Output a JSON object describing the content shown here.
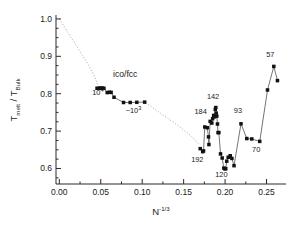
{
  "figure": {
    "background": "#ffffff",
    "marker_color": "#111111",
    "line_color": "#3a3a3a",
    "guide_color": "#9a9a9a",
    "axis_color": "#2b2b2b"
  },
  "axes": {
    "x_title_main": "N",
    "x_title_sup": "-1/3",
    "y_title_t": "T",
    "y_title_melt": "melt",
    "y_title_slash": " / T",
    "y_title_bulk": "Bulk",
    "x_ticks": [
      "0.00",
      "0.05",
      "0.10",
      "0.15",
      "0.20",
      "0.25"
    ],
    "x_tick_values": [
      0.0,
      0.05,
      0.1,
      0.15,
      0.2,
      0.25
    ],
    "y_ticks": [
      "0.6",
      "0.7",
      "0.8",
      "0.9",
      "1.0"
    ],
    "y_tick_values": [
      0.6,
      0.7,
      0.8,
      0.9,
      1.0
    ],
    "xlim": [
      -0.004,
      0.2735
    ],
    "ylim": [
      0.5585,
      1.0105
    ],
    "grid": "off"
  },
  "annotations": [
    {
      "name": "ico-fcc",
      "text": "ico/fcc",
      "x": 0.0795,
      "y": 0.846,
      "size": "normal"
    },
    {
      "name": "ten-to-four",
      "text": "10",
      "sup": "4",
      "x": 0.0465,
      "y": 0.797,
      "size": "small"
    },
    {
      "name": "ten-to-three",
      "text": "~10",
      "sup": "3",
      "x": 0.0895,
      "y": 0.749,
      "size": "small"
    },
    {
      "name": "label-184",
      "text": "184",
      "x": 0.1705,
      "y": 0.747,
      "size": "small"
    },
    {
      "name": "label-142",
      "text": "142",
      "x": 0.1855,
      "y": 0.787,
      "size": "small"
    },
    {
      "name": "label-192",
      "text": "192",
      "x": 0.1665,
      "y": 0.617,
      "size": "small"
    },
    {
      "name": "label-120",
      "text": "120",
      "x": 0.1955,
      "y": 0.578,
      "size": "small"
    },
    {
      "name": "label-93",
      "text": "93",
      "x": 0.2155,
      "y": 0.748,
      "size": "small"
    },
    {
      "name": "label-70",
      "text": "70",
      "x": 0.2375,
      "y": 0.643,
      "size": "small"
    },
    {
      "name": "label-57",
      "text": "57",
      "x": 0.2545,
      "y": 0.898,
      "size": "small"
    }
  ],
  "chart_data": {
    "type": "scatter",
    "title": "",
    "xlabel": "N^-1/3",
    "ylabel": "T_melt / T_Bulk",
    "xlim": [
      -0.004,
      0.2735
    ],
    "ylim": [
      0.5585,
      1.0105
    ],
    "grid": "off",
    "legend": "none",
    "series": [
      {
        "name": "ico/fcc plateau (large clusters)",
        "marker": "square",
        "connected": true,
        "points": [
          [
            0.0455,
            0.8145
          ],
          [
            0.048,
            0.815
          ],
          [
            0.05,
            0.815
          ],
          [
            0.0518,
            0.815
          ],
          [
            0.0538,
            0.8145
          ],
          [
            0.0578,
            0.803
          ],
          [
            0.0605,
            0.804
          ],
          [
            0.0625,
            0.8035
          ],
          [
            0.066,
            0.7905
          ],
          [
            0.0775,
            0.7765
          ],
          [
            0.0855,
            0.7765
          ],
          [
            0.0935,
            0.777
          ],
          [
            0.103,
            0.7775
          ]
        ]
      },
      {
        "name": "small clusters (magic numbers)",
        "marker": "square",
        "connected": true,
        "points": [
          [
            0.17,
            0.653
          ],
          [
            0.173,
            0.645
          ],
          [
            0.174,
            0.647
          ],
          [
            0.1755,
            0.711
          ],
          [
            0.1785,
            0.709
          ],
          [
            0.18,
            0.6845
          ],
          [
            0.1805,
            0.664
          ],
          [
            0.182,
            0.726
          ],
          [
            0.184,
            0.7215
          ],
          [
            0.185,
            0.733
          ],
          [
            0.1862,
            0.742
          ],
          [
            0.1872,
            0.738
          ],
          [
            0.1882,
            0.758
          ],
          [
            0.1888,
            0.763
          ],
          [
            0.1893,
            0.748
          ],
          [
            0.19,
            0.74
          ],
          [
            0.1908,
            0.719
          ],
          [
            0.1915,
            0.696
          ],
          [
            0.1925,
            0.696
          ],
          [
            0.1945,
            0.639
          ],
          [
            0.1965,
            0.628
          ],
          [
            0.1985,
            0.601
          ],
          [
            0.1998,
            0.599
          ],
          [
            0.2008,
            0.5995
          ],
          [
            0.202,
            0.6195
          ],
          [
            0.2038,
            0.63
          ],
          [
            0.2062,
            0.634
          ],
          [
            0.2082,
            0.627
          ],
          [
            0.2108,
            0.6075
          ],
          [
            0.2192,
            0.7195
          ],
          [
            0.2262,
            0.68
          ],
          [
            0.2322,
            0.679
          ],
          [
            0.2418,
            0.6725
          ],
          [
            0.2512,
            0.81
          ],
          [
            0.2588,
            0.873
          ],
          [
            0.2632,
            0.835
          ]
        ]
      }
    ],
    "guide_curves": [
      {
        "name": "bulk-limit-dotted-upper",
        "style": "dotted",
        "points": [
          [
            0.0,
            1.0
          ],
          [
            0.007,
            0.976
          ],
          [
            0.014,
            0.951
          ],
          [
            0.0215,
            0.925
          ],
          [
            0.029,
            0.899
          ],
          [
            0.0365,
            0.872
          ],
          [
            0.043,
            0.844
          ],
          [
            0.0468,
            0.82
          ]
        ]
      },
      {
        "name": "bulk-limit-dotted-lower",
        "style": "dotted",
        "points": [
          [
            0.104,
            0.776
          ],
          [
            0.122,
            0.748
          ],
          [
            0.14,
            0.72
          ],
          [
            0.156,
            0.693
          ],
          [
            0.169,
            0.664
          ]
        ]
      }
    ]
  }
}
